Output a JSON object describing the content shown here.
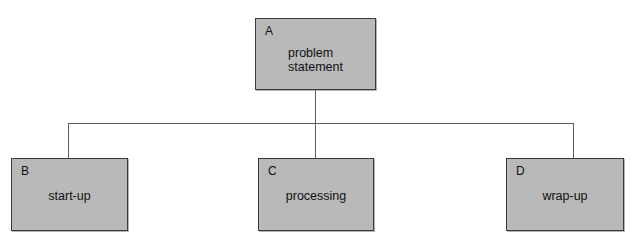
{
  "diagram": {
    "type": "hierarchy-tree",
    "title": "",
    "background_color": "#ffffff",
    "node_fill_color": "#b9b9b9",
    "node_border_color": "#3a3a3a",
    "connector_color": "#5e5e5e",
    "nodes": [
      {
        "id": "A",
        "letter": "A",
        "label_lines": [
          "problem",
          "statement"
        ],
        "level": "root"
      },
      {
        "id": "B",
        "letter": "B",
        "label_lines": [
          "start-up"
        ],
        "level": "child"
      },
      {
        "id": "C",
        "letter": "C",
        "label_lines": [
          "processing"
        ],
        "level": "child"
      },
      {
        "id": "D",
        "letter": "D",
        "label_lines": [
          "wrap-up"
        ],
        "level": "child"
      }
    ],
    "edges": [
      {
        "from": "A",
        "to": "B"
      },
      {
        "from": "A",
        "to": "C"
      },
      {
        "from": "A",
        "to": "D"
      }
    ]
  }
}
